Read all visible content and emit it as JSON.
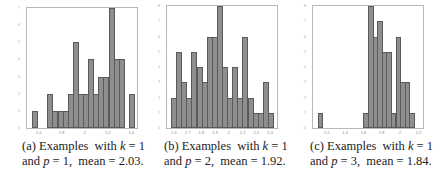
{
  "chart_data": [
    {
      "type": "bar",
      "title": "",
      "caption": "(a) Examples with k = 1 and p = 1, mean = 2.03.",
      "xlabel": "",
      "ylabel": "",
      "x_ticks": [
        "1.6",
        "1.8",
        "2",
        "2.2",
        "2.4"
      ],
      "xlim": [
        1.5,
        2.45
      ],
      "ylim": [
        0,
        7
      ],
      "y_ticks": [
        0,
        1,
        2,
        3,
        4,
        5,
        6,
        7
      ],
      "bin_starts": [
        1.55,
        1.6,
        1.65,
        1.7,
        1.75,
        1.8,
        1.85,
        1.9,
        1.95,
        2.0,
        2.05,
        2.1,
        2.15,
        2.2,
        2.25,
        2.3,
        2.35,
        2.4
      ],
      "values": [
        1,
        0,
        0,
        2,
        1,
        1,
        1,
        2,
        5,
        2,
        2,
        4,
        2,
        3,
        3,
        7,
        4,
        4,
        0,
        2
      ]
    },
    {
      "type": "bar",
      "title": "",
      "caption": "(b) Examples with k = 1 and p = 2, mean = 1.92.",
      "xlabel": "",
      "ylabel": "",
      "x_ticks": [
        "1.6",
        "1.7",
        "1.8",
        "1.9",
        "2",
        "2.1",
        "2.2",
        "2.3"
      ],
      "xlim": [
        1.55,
        2.35
      ],
      "ylim": [
        0,
        8
      ],
      "y_ticks": [
        0,
        1,
        2,
        3,
        4,
        5,
        6,
        7,
        8
      ],
      "values": [
        2,
        5,
        3,
        2,
        5,
        4,
        3,
        6,
        6,
        8,
        4,
        2,
        4,
        2,
        6,
        2,
        1,
        1,
        3,
        1
      ]
    },
    {
      "type": "bar",
      "title": "",
      "caption": "(c) Examples with k = 1 and p = 3, mean = 1.84.",
      "xlabel": "",
      "ylabel": "",
      "x_ticks": [
        "1.2",
        "1.4",
        "1.6",
        "1.8",
        "2",
        "2.2"
      ],
      "xlim": [
        1.05,
        2.25
      ],
      "ylim": [
        0,
        8
      ],
      "y_ticks": [
        0,
        1,
        2,
        3,
        4,
        5,
        6,
        7,
        8
      ],
      "bars": [
        {
          "x": 1.1,
          "value": 1
        },
        {
          "x": 1.6,
          "value": 1
        },
        {
          "x": 1.65,
          "value": 8
        },
        {
          "x": 1.7,
          "value": 6
        },
        {
          "x": 1.75,
          "value": 7
        },
        {
          "x": 1.8,
          "value": 5
        },
        {
          "x": 1.85,
          "value": 5
        },
        {
          "x": 1.9,
          "value": 1
        },
        {
          "x": 1.95,
          "value": 6
        },
        {
          "x": 2.0,
          "value": 3
        },
        {
          "x": 2.05,
          "value": 3
        },
        {
          "x": 2.1,
          "value": 1
        }
      ]
    }
  ],
  "captions": {
    "a": {
      "label": "(a)",
      "line1_pre": "Examples  with ",
      "k": "k",
      "line1_post": " = 1",
      "line2_pre": "and ",
      "p": "p",
      "line2_post": " = 1,  mean = 2.03."
    },
    "b": {
      "label": "(b)",
      "line1_pre": "Examples  with ",
      "k": "k",
      "line1_post": " = 1",
      "line2_pre": "and ",
      "p": "p",
      "line2_post": " = 2,  mean = 1.92."
    },
    "c": {
      "label": "(c)",
      "line1_pre": "Examples  with ",
      "k": "k",
      "line1_post": " = 1",
      "line2_pre": "and ",
      "p": "p",
      "line2_post": " = 3,  mean = 1.84."
    }
  }
}
